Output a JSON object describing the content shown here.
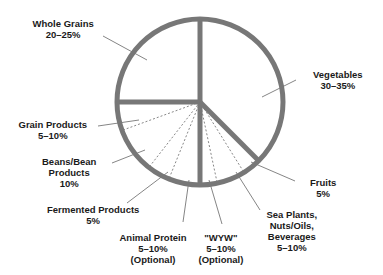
{
  "chart_data": {
    "type": "pie",
    "title": "",
    "center": [
      200,
      102
    ],
    "radius": 83,
    "colors": {
      "stroke": "#777777",
      "leader": "#666666",
      "text": "#1a1a1a",
      "background": "#ffffff"
    },
    "slices": [
      {
        "name": "Whole Grains",
        "value": "20–25%",
        "low": 20,
        "high": 25
      },
      {
        "name": "Vegetables",
        "value": "30–35%",
        "low": 30,
        "high": 35
      },
      {
        "name": "Fruits",
        "value": "5%",
        "low": 5,
        "high": 5
      },
      {
        "name": "Sea Plants, Nuts/Oils, Beverages",
        "value": "5–10%",
        "low": 5,
        "high": 10
      },
      {
        "name": "\"WYW\"",
        "value": "5–10%",
        "low": 5,
        "high": 10,
        "note": "(Optional)"
      },
      {
        "name": "Animal Protein",
        "value": "5–10%",
        "low": 5,
        "high": 10,
        "note": "(Optional)"
      },
      {
        "name": "Fermented Products",
        "value": "5%",
        "low": 5,
        "high": 5
      },
      {
        "name": "Beans/Bean Products",
        "value": "10%",
        "low": 10,
        "high": 10
      },
      {
        "name": "Grain Products",
        "value": "5–10%",
        "low": 5,
        "high": 10
      }
    ],
    "labels": [
      {
        "lines": [
          "Whole Grains",
          "20–25%"
        ],
        "x": 63,
        "y": 18
      },
      {
        "lines": [
          "Vegetables",
          "30–35%"
        ],
        "x": 338,
        "y": 69
      },
      {
        "lines": [
          "Fruits",
          "5%"
        ],
        "x": 323,
        "y": 177
      },
      {
        "lines": [
          "Sea Plants,",
          "Nuts/Oils,",
          "Beverages",
          "5–10%"
        ],
        "x": 292,
        "y": 209
      },
      {
        "lines": [
          "\"WYW\"",
          "5–10%",
          "(Optional)"
        ],
        "x": 221,
        "y": 232
      },
      {
        "lines": [
          "Animal Protein",
          "5–10%",
          "(Optional)"
        ],
        "x": 153,
        "y": 232
      },
      {
        "lines": [
          "Fermented Products",
          "5%"
        ],
        "x": 93,
        "y": 204
      },
      {
        "lines": [
          "Beans/Bean",
          "Products",
          "10%"
        ],
        "x": 69,
        "y": 156
      },
      {
        "lines": [
          "Grain Products",
          "5–10%"
        ],
        "x": 53,
        "y": 119
      }
    ],
    "solid_dividers_deg": [
      270,
      180,
      90,
      45
    ],
    "dashed_dividers_deg": [
      160,
      128,
      112,
      78,
      58
    ],
    "leaders": [
      [
        103,
        36,
        147,
        60
      ],
      [
        296,
        80,
        262,
        97
      ],
      [
        295,
        181,
        251,
        162
      ],
      [
        260,
        210,
        236,
        172
      ],
      [
        222,
        224,
        209,
        180
      ],
      [
        183,
        222,
        189,
        180
      ],
      [
        127,
        203,
        168,
        172
      ],
      [
        112,
        163,
        145,
        150
      ],
      [
        98,
        126,
        139,
        120
      ]
    ]
  }
}
